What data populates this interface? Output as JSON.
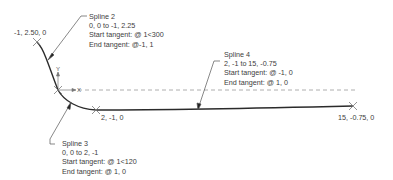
{
  "points": {
    "start": "-1, 2.50, 0",
    "mid": "2, -1, 0",
    "end": "15, -0.75, 0"
  },
  "axes": {
    "y_label": "Y",
    "x_label": "X"
  },
  "callouts": [
    {
      "title": "Spline 2",
      "range": "0, 0 to -1, 2.25",
      "start_tangent": "Start tangent: @ 1<300",
      "end_tangent": "End tangent: @-1, 1"
    },
    {
      "title": "Spline 3",
      "range": "0, 0 to 2, -1",
      "start_tangent": "Start tangent: @ 1<120",
      "end_tangent": "End tangent: @ 1, 0"
    },
    {
      "title": "Spline 4",
      "range": "2, -1 to 15, -0.75",
      "start_tangent": "Start tangent: @ -1, 0",
      "end_tangent": "End tangent: @ 1, 0"
    }
  ],
  "colors": {
    "curve": "#2b2b2b",
    "leader": "#555555",
    "dashed": "#9a9a9a",
    "marker": "#777777"
  }
}
